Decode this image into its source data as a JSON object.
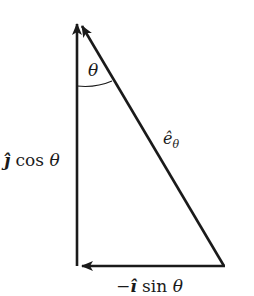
{
  "diagram": {
    "type": "vector-decomposition-triangle",
    "labels": {
      "angle": "θ",
      "hypotenuse_vector": "ê",
      "hypotenuse_subscript": "θ",
      "vertical_component_vec": "ĵ",
      "vertical_component_rest": " cos ",
      "vertical_component_angle": "θ",
      "horizontal_component_sign": "−",
      "horizontal_component_vec": "î",
      "horizontal_component_rest": " sin ",
      "horizontal_component_angle": "θ"
    },
    "colors": {
      "stroke": "#1a1a1a",
      "background": "#ffffff"
    }
  }
}
